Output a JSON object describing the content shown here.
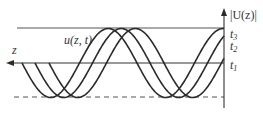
{
  "diagram": {
    "title_label": "u(z, t)",
    "z_axis_label": "z",
    "vertical_axis_label": "|U(z)|",
    "time_labels": [
      {
        "base": "t",
        "sub": "3"
      },
      {
        "base": "t",
        "sub": "2"
      },
      {
        "base": "t",
        "sub": "1"
      }
    ],
    "colors": {
      "line": "#2b2b2b",
      "dashed": "#555555",
      "background": "#ffffff"
    }
  },
  "chart_data": {
    "type": "line",
    "xlabel": "z",
    "ylabel": "|U(z)|",
    "axis_x_px": 224,
    "envelope_top_y_px": 28,
    "centerline_y_px": 63,
    "envelope_bottom_y_px": 97,
    "period_px": 115,
    "series": [
      {
        "name": "t3",
        "start_x_px": 22,
        "end_x_px": 224
      },
      {
        "name": "t2",
        "start_x_px": 35,
        "end_x_px": 224
      },
      {
        "name": "t1",
        "start_x_px": 49,
        "end_x_px": 224
      }
    ]
  }
}
